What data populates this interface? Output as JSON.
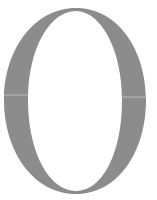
{
  "glyph": {
    "character": "O",
    "style": "serif",
    "color": "#8c8c8c",
    "background": "#ffffff"
  }
}
